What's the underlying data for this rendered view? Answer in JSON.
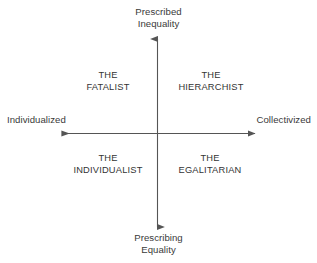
{
  "diagram": {
    "type": "two-axis-quadrant",
    "line_color": "#555555",
    "text_color": "#333333",
    "background_color": "#ffffff",
    "axes": {
      "vertical": {
        "top_label_line1": "Prescribed",
        "top_label_line2": "Inequality",
        "bottom_label_line1": "Prescribing",
        "bottom_label_line2": "Equality",
        "arrowheads": "both"
      },
      "horizontal": {
        "left_label": "Individualized",
        "right_label": "Collectivized",
        "arrowheads": "both"
      }
    },
    "quadrants": [
      {
        "position": "top-left",
        "line1": "THE",
        "line2": "FATALIST"
      },
      {
        "position": "top-right",
        "line1": "THE",
        "line2": "HIERARCHIST"
      },
      {
        "position": "bottom-left",
        "line1": "THE",
        "line2": "INDIVIDUALIST"
      },
      {
        "position": "bottom-right",
        "line1": "THE",
        "line2": "EGALITARIAN"
      }
    ]
  }
}
